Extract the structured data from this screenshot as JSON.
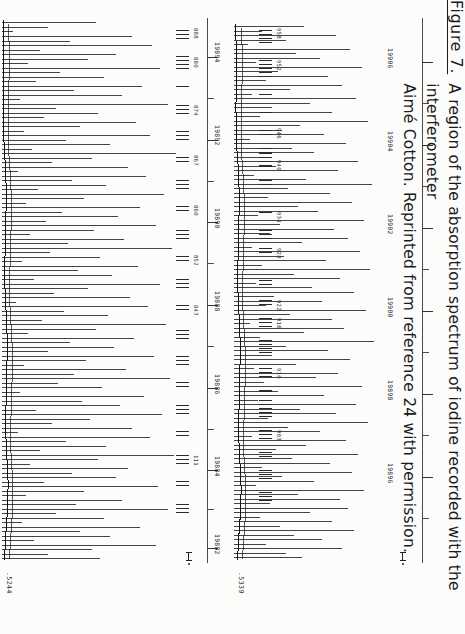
{
  "figure": {
    "label": "Figure 7.",
    "caption_line1": "A region of the absorption spectrum of iodine recorded with the interferometer",
    "caption_line2": "Aimé Cotton.  Reprinted from reference 24 with permission."
  },
  "panels": [
    {
      "id": "upper",
      "ordinate_label": ".5244",
      "scalebar_marker": "├┤ .",
      "axis_title": "wavenumber",
      "axis_ticks": [
        {
          "value": "19882"
        },
        {
          "value": "19884"
        },
        {
          "value": "19886"
        },
        {
          "value": "19888"
        },
        {
          "value": "19890"
        },
        {
          "value": "19892"
        },
        {
          "value": "19894"
        }
      ],
      "comb_labels": [
        "111",
        "843",
        "852",
        "860",
        "867",
        "874",
        "880",
        "888"
      ]
    },
    {
      "id": "lower",
      "ordinate_label": ".5339",
      "scalebar_marker": "├┤ .",
      "axis_title": "wavenumber",
      "axis_ticks": [
        {
          "value": "19896"
        },
        {
          "value": "19898"
        },
        {
          "value": "19900"
        },
        {
          "value": "19902"
        },
        {
          "value": "19904"
        },
        {
          "value": "19906"
        }
      ],
      "comb_labels": [
        "903",
        "910",
        "916",
        "922",
        "928",
        "934",
        "940",
        "946",
        "952",
        "958"
      ]
    }
  ],
  "colors": {
    "ink": "#1a1a1a",
    "axis": "#4a4a4a",
    "paper": "#fcfcfa"
  }
}
